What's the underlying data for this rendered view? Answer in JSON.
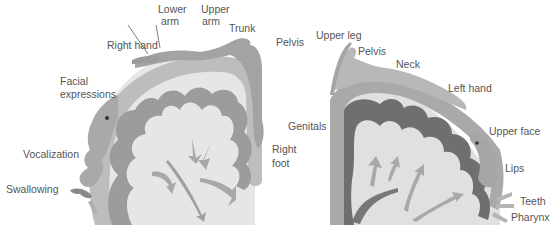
{
  "diagram": {
    "type": "anatomical-illustration",
    "panels": [
      {
        "id": "left",
        "subject": "motor-homunculus-cortex-section",
        "labels": {
          "lower_arm_1": "Lower",
          "lower_arm_2": "arm",
          "upper_arm_1": "Upper",
          "upper_arm_2": "arm",
          "trunk": "Trunk",
          "pelvis": "Pelvis",
          "right_hand": "Right hand",
          "facial_1": "Facial",
          "facial_2": "expressions",
          "vocalization": "Vocalization",
          "swallowing": "Swallowing",
          "right_foot_1": "Right",
          "right_foot_2": "foot"
        }
      },
      {
        "id": "right",
        "subject": "sensory-homunculus-cortex-section",
        "labels": {
          "upper_leg": "Upper leg",
          "pelvis": "Pelvis",
          "neck": "Neck",
          "left_hand": "Left hand",
          "genitals": "Genitals",
          "upper_face": "Upper face",
          "lips": "Lips",
          "teeth": "Teeth",
          "pharynx": "Pharynx"
        }
      }
    ],
    "colors": {
      "background": "#ffffff",
      "label_text": "#555555",
      "cortex_fill": "#c9c9c9",
      "cortex_outer": "#b3b3b3",
      "gray_matter_light": "#9a9a9a",
      "gray_matter_dark": "#6e6e6e",
      "white_matter": "#e4e4e4",
      "arrow_fill": "#a8a8a8"
    }
  }
}
